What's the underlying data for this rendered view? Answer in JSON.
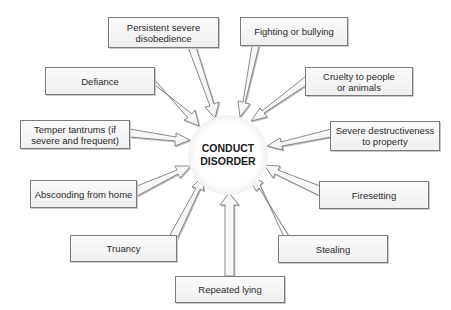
{
  "diagram": {
    "type": "hub-and-spoke",
    "center": {
      "line1": "CONDUCT",
      "line2": "DISORDER"
    },
    "colors": {
      "box_fill": "#f4f4f4",
      "box_border": "#7a7a7a",
      "arrow_fill": "#f7f7f7",
      "arrow_stroke": "#6e6e6e",
      "text": "#2a2a2a"
    },
    "nodes": [
      {
        "id": "persistent-disobedience",
        "label": "Persistent severe disobedience"
      },
      {
        "id": "fighting-bullying",
        "label": "Fighting or bullying"
      },
      {
        "id": "defiance",
        "label": "Defiance"
      },
      {
        "id": "cruelty",
        "label": "Cruelty to people or animals"
      },
      {
        "id": "temper-tantrums",
        "label": "Temper tantrums (if severe and frequent)"
      },
      {
        "id": "destructiveness",
        "label": "Severe destructiveness to property"
      },
      {
        "id": "absconding",
        "label": "Absconding from home"
      },
      {
        "id": "firesetting",
        "label": "Firesetting"
      },
      {
        "id": "truancy",
        "label": "Truancy"
      },
      {
        "id": "stealing",
        "label": "Stealing"
      },
      {
        "id": "repeated-lying",
        "label": "Repeated lying"
      }
    ],
    "edges_direction": "all nodes point to center"
  }
}
